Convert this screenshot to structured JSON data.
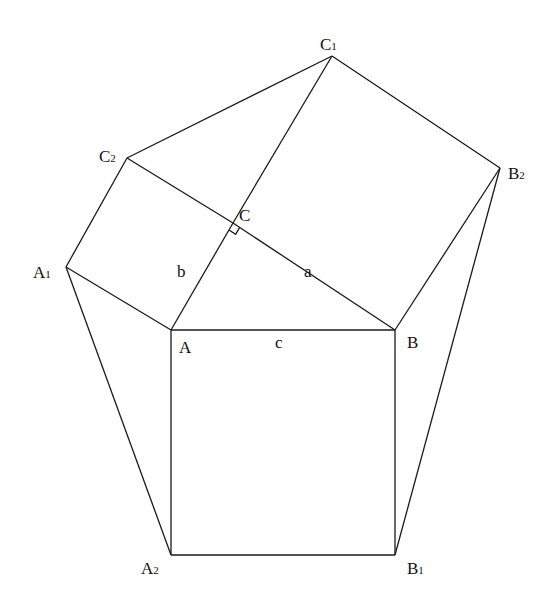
{
  "points": {
    "A": {
      "label": "A",
      "sub": ""
    },
    "B": {
      "label": "B",
      "sub": ""
    },
    "C": {
      "label": "C",
      "sub": ""
    },
    "A1": {
      "label": "A",
      "sub": "1"
    },
    "A2": {
      "label": "A",
      "sub": "2"
    },
    "B1": {
      "label": "B",
      "sub": "1"
    },
    "B2": {
      "label": "B",
      "sub": "2"
    },
    "C1": {
      "label": "C",
      "sub": "1"
    },
    "C2": {
      "label": "C",
      "sub": "2"
    }
  },
  "segments": [
    [
      "A",
      "B"
    ],
    [
      "B",
      "B1"
    ],
    [
      "B1",
      "A2"
    ],
    [
      "A2",
      "A"
    ],
    [
      "A",
      "C"
    ],
    [
      "C",
      "C1"
    ],
    [
      "C1",
      "C2"
    ],
    [
      "C2",
      "C"
    ],
    [
      "C2",
      "A1"
    ],
    [
      "A1",
      "A"
    ],
    [
      "C1",
      "B2"
    ],
    [
      "B2",
      "B"
    ],
    [
      "A1",
      "A2"
    ],
    [
      "B2",
      "B1"
    ],
    [
      "C",
      "B"
    ]
  ],
  "side_labels": {
    "a": "a",
    "b": "b",
    "c": "c"
  },
  "right_angle_at": "C"
}
